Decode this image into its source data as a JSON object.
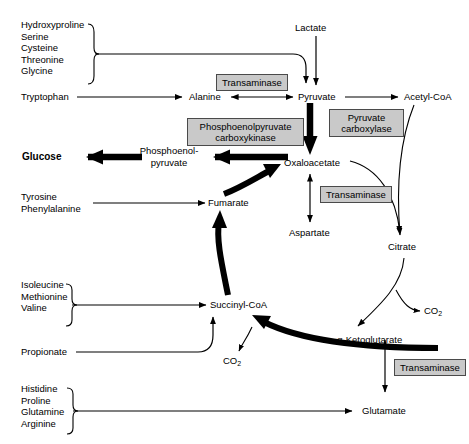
{
  "diagram": {
    "colors": {
      "background": "#ffffff",
      "line": "#000000",
      "enzyme_box_fill": "#c9c9c9",
      "enzyme_box_border": "#4a4a4a"
    }
  },
  "amino_acid_groups": [
    {
      "id": "group-to-pyruvate",
      "items": [
        "Hydroxyproline",
        "Serine",
        "Cysteine",
        "Threonine",
        "Glycine"
      ]
    },
    {
      "id": "group-to-succinyl-coa",
      "items": [
        "Isoleucine",
        "Methionine",
        "Valine"
      ]
    },
    {
      "id": "group-to-glutamate",
      "items": [
        "Histidine",
        "Proline",
        "Glutamine",
        "Arginine"
      ]
    }
  ],
  "metabolites": {
    "lactate": "Lactate",
    "tryptophan": "Tryptophan",
    "alanine": "Alanine",
    "pyruvate": "Pyruvate",
    "acetyl_coa": "Acetyl-CoA",
    "glucose": "Glucose",
    "pep_line1": "Phosphoenol-",
    "pep_line2": "pyruvate",
    "oxaloacetate": "Oxaloacetate",
    "aspartate": "Aspartate",
    "citrate": "Citrate",
    "fumarate": "Fumarate",
    "tyrosine": "Tyrosine",
    "phenylalanine": "Phenylalanine",
    "succinyl_coa": "Succinyl-CoA",
    "propionate": "Propionate",
    "alpha_ketoglutarate": "α-Ketoglutarate",
    "glutamate": "Glutamate",
    "co2_a": "CO",
    "co2_b": "CO",
    "co2_subscript": "2"
  },
  "enzymes": {
    "transaminase_pyruvate": "Transaminase",
    "pyruvate_carboxylase_line1": "Pyruvate",
    "pyruvate_carboxylase_line2": "carboxylase",
    "pepck_line1": "Phosphoenolpyruvate",
    "pepck_line2": "carboxykinase",
    "transaminase_oxaloacetate": "Transaminase",
    "transaminase_ketoglutarate": "Transaminase"
  }
}
